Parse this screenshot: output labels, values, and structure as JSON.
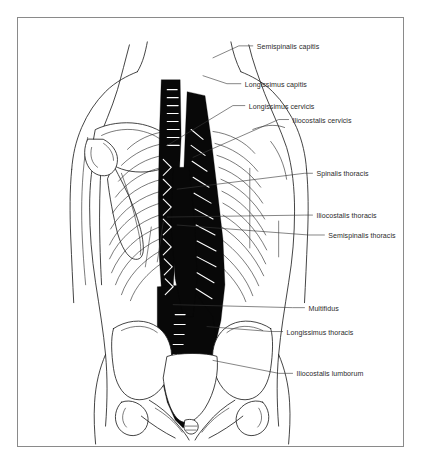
{
  "figure": {
    "kind": "anatomical-illustration",
    "orientation": "posterior",
    "style": "black-and-white line drawing with solid black muscle masses",
    "border_color": "#8a8a8a",
    "background_color": "#ffffff",
    "ink_color": "#1a1a1a",
    "muscle_fill_color": "#080808",
    "label_color": "#2b2b2b",
    "leader_color": "#3a3a3a"
  },
  "labels": [
    {
      "id": "semispinalis-capitis",
      "text": "Semispinalis capitis",
      "x": 240,
      "y": 28,
      "leader": "M236 28 L222 28 L196 40"
    },
    {
      "id": "longissimus-capitis",
      "text": "Longissimus capitis",
      "x": 228,
      "y": 66,
      "leader": "M224 66 L210 66 L186 58"
    },
    {
      "id": "longissimus-cervicis",
      "text": "Longissimus cervicis",
      "x": 232,
      "y": 88,
      "leader": "M228 88 L216 88 L150 128"
    },
    {
      "id": "iliocostalis-cervicis",
      "text": "Iliocostalis cervicis",
      "x": 276,
      "y": 102,
      "leader": "M272 102 L262 102 L176 140"
    },
    {
      "id": "spinalis-thoracis",
      "text": "Spinalis thoracis",
      "x": 300,
      "y": 156,
      "leader": "M296 156 L288 156 L160 172"
    },
    {
      "id": "iliocostalis-thoracis",
      "text": "Iliocostalis thoracis",
      "x": 300,
      "y": 198,
      "leader": "M296 198 L288 198 L150 200"
    },
    {
      "id": "semispinalis-thoracis",
      "text": "Semispinalis thoracis",
      "x": 312,
      "y": 218,
      "leader": "M308 218 L292 218 L160 208"
    },
    {
      "id": "multifidus",
      "text": "Multifidus",
      "x": 292,
      "y": 291,
      "leader": "M288 291 L276 291 L156 288"
    },
    {
      "id": "longissimus-thoracis",
      "text": "Longissimus thoracis",
      "x": 270,
      "y": 315,
      "leader": "M266 315 L254 315 L190 310"
    },
    {
      "id": "iliocostalis-lumborum",
      "text": "Iliocostalis lumborum",
      "x": 280,
      "y": 357,
      "leader": "M276 357 L262 357 L196 344"
    }
  ],
  "regions": [
    {
      "id": "head-neck",
      "name": "Cervical region"
    },
    {
      "id": "left-shoulder",
      "name": "Left shoulder with scapula and humerus"
    },
    {
      "id": "right-shoulder",
      "name": "Right shoulder with scapula and humerus"
    },
    {
      "id": "rib-cage",
      "name": "Thoracic rib cage, twelve pairs of ribs"
    },
    {
      "id": "erector-spinae",
      "name": "Erector spinae muscle column"
    },
    {
      "id": "pelvis",
      "name": "Pelvis with iliac crests, sacrum and coccyx"
    }
  ]
}
